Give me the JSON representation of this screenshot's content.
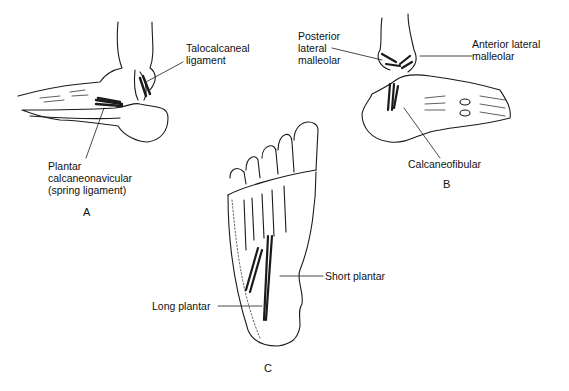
{
  "figure": {
    "panels": [
      {
        "id": "A",
        "label": "A",
        "labels": [
          {
            "key": "talocalcaneal",
            "lines": [
              "Talocalcaneal",
              "ligament"
            ]
          },
          {
            "key": "plantar_calcaneonavicular",
            "lines": [
              "Plantar",
              "calcaneonavicular",
              "(spring ligament)"
            ]
          }
        ]
      },
      {
        "id": "B",
        "label": "B",
        "labels": [
          {
            "key": "posterior_lateral_malleolar",
            "lines": [
              "Posterior",
              "lateral",
              "malleolar"
            ]
          },
          {
            "key": "anterior_lateral_malleolar",
            "lines": [
              "Anterior lateral",
              "malleolar"
            ]
          },
          {
            "key": "calcaneofibular",
            "lines": [
              "Calcaneofibular"
            ]
          }
        ]
      },
      {
        "id": "C",
        "label": "C",
        "labels": [
          {
            "key": "short_plantar",
            "lines": [
              "Short plantar"
            ]
          },
          {
            "key": "long_plantar",
            "lines": [
              "Long plantar"
            ]
          }
        ]
      }
    ]
  }
}
